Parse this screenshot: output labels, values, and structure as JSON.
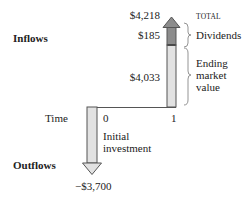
{
  "diagram": {
    "labels": {
      "inflows": "Inflows",
      "outflows": "Outflows",
      "time": "Time",
      "total_header": "TOTAL"
    },
    "timeline": {
      "points": [
        "0",
        "1"
      ]
    },
    "inflow_arrow": {
      "total_value": "$4,218",
      "segments": [
        {
          "name": "Dividends",
          "value": "$185",
          "color": "#8c8c8c"
        },
        {
          "name": "Ending market value",
          "value": "$4,033",
          "color": "#e2e2e2"
        }
      ],
      "segment_labels": {
        "dividends": "Dividends",
        "ending_line1": "Ending",
        "ending_line2": "market",
        "ending_line3": "value"
      }
    },
    "outflow_arrow": {
      "value": "−$3,700",
      "label_line1": "Initial",
      "label_line2": "investment",
      "color": "#e2e2e2"
    },
    "colors": {
      "dark_segment": "#8c8c8c",
      "light_segment": "#e2e2e2",
      "outline": "#555555",
      "brace": "#888888"
    }
  }
}
